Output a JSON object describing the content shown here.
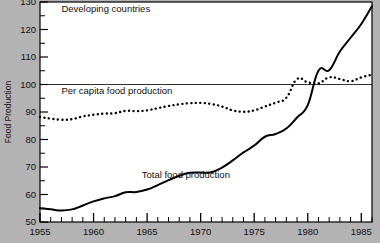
{
  "chart_data": {
    "type": "line",
    "title": "",
    "xlabel": "",
    "ylabel": "Food Production",
    "xlim": [
      1955,
      1986
    ],
    "ylim": [
      50,
      130
    ],
    "grid": false,
    "legend_position": "inline-annotations",
    "annotations": [
      {
        "name": "region-label",
        "text": "Developing countries",
        "x": 1957.0,
        "y": 126.5
      },
      {
        "name": "per-capita-series-label",
        "text": "Per capita food production",
        "x": 1957.0,
        "y": 96.5
      },
      {
        "name": "total-series-label",
        "text": "Total food production",
        "x": 1964.5,
        "y": 66.0
      }
    ],
    "reference_lines": [
      {
        "name": "index-100-line",
        "axis": "y",
        "value": 100
      }
    ],
    "xticks_major": [
      1955,
      1960,
      1965,
      1970,
      1975,
      1980,
      1985
    ],
    "xtick_labels": [
      "1955",
      "1960",
      "1965",
      "1970",
      "1975",
      "1980",
      "1985"
    ],
    "xticks_minor_step": 1,
    "yticks_major": [
      50,
      60,
      70,
      80,
      90,
      100,
      110,
      120,
      130
    ],
    "ytick_labels": [
      "50",
      "60",
      "70",
      "80",
      "90",
      "100",
      "110",
      "120",
      "130"
    ],
    "yticks_minor": [
      55,
      65,
      75,
      85,
      95,
      105,
      115,
      125
    ],
    "x": [
      1955,
      1956,
      1957,
      1958,
      1959,
      1960,
      1961,
      1962,
      1963,
      1964,
      1965,
      1966,
      1967,
      1968,
      1969,
      1970,
      1971,
      1972,
      1973,
      1974,
      1975,
      1976,
      1977,
      1978,
      1979,
      1980,
      1981,
      1982,
      1983,
      1984,
      1985,
      1986
    ],
    "series": [
      {
        "name": "Total food production",
        "style": "solid",
        "color": "#000000",
        "values": [
          55.0,
          54.6,
          54.2,
          54.6,
          56.0,
          57.5,
          58.6,
          59.4,
          60.8,
          60.9,
          61.8,
          63.4,
          65.2,
          66.8,
          67.9,
          68.0,
          68.1,
          69.8,
          72.4,
          75.3,
          77.8,
          81.0,
          82.0,
          84.0,
          88.0,
          92.5,
          97.0,
          100.5,
          104.6,
          105.2,
          105.3,
          108.5
        ]
      },
      {
        "name": "Per capita food production",
        "style": "dotted",
        "color": "#000000",
        "values": [
          88.2,
          87.6,
          87.2,
          87.4,
          88.4,
          89.0,
          89.4,
          89.6,
          90.4,
          90.3,
          90.6,
          91.4,
          92.2,
          92.8,
          93.2,
          93.3,
          92.9,
          92.0,
          90.6,
          90.1,
          90.6,
          92.0,
          93.4,
          95.2,
          97.6,
          99.6,
          101.2,
          101.8,
          102.4,
          101.2,
          100.6,
          101.4
        ]
      }
    ]
  },
  "total_series_tail": {
    "x": [
      1981,
      1982,
      1983,
      1984,
      1985,
      1986
    ],
    "values": [
      105.0,
      105.2,
      112.0,
      117.0,
      122.0,
      128.5
    ]
  },
  "per_capita_tail": {
    "x": [
      1979,
      1980,
      1981,
      1982,
      1983,
      1984,
      1985,
      1986
    ],
    "values": [
      102.0,
      100.8,
      100.4,
      102.6,
      102.0,
      101.2,
      102.6,
      103.6
    ]
  }
}
